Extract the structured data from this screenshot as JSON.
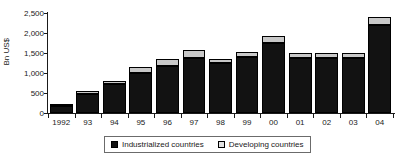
{
  "chart_data": {
    "type": "bar",
    "title": "",
    "subtitle": "",
    "xlabel": "",
    "ylabel": "Bn US$",
    "ylim": [
      0,
      2500
    ],
    "yticks": [
      0,
      500,
      1000,
      1500,
      2000,
      2500
    ],
    "ytick_labels": [
      "0",
      "500",
      "1,000",
      "1,500",
      "2,000",
      "2,500"
    ],
    "grid": false,
    "stacked": true,
    "legend_position": "bottom",
    "categories": [
      "1992",
      "93",
      "94",
      "95",
      "96",
      "97",
      "98",
      "99",
      "00",
      "01",
      "02",
      "03",
      "04"
    ],
    "series": [
      {
        "name": "Industrialized countries",
        "color": "#121212",
        "values": [
          175,
          480,
          725,
          1000,
          1175,
          1375,
          1250,
          1400,
          1750,
          1375,
          1375,
          1375,
          2200
        ]
      },
      {
        "name": "Developing countries",
        "color": "#c8c8c8",
        "values": [
          25,
          60,
          75,
          150,
          175,
          200,
          100,
          125,
          175,
          125,
          125,
          125,
          200
        ]
      }
    ],
    "totals": [
      200,
      540,
      800,
      1150,
      1350,
      1575,
      1350,
      1525,
      1925,
      1500,
      1500,
      1500,
      2400
    ]
  },
  "legend": {
    "entries": [
      {
        "label": "Industrialized countries",
        "swatch": "black-square-swatch"
      },
      {
        "label": "Developing countries",
        "swatch": "light-square-swatch"
      }
    ]
  },
  "axis": {
    "y_label": "Bn US$"
  }
}
